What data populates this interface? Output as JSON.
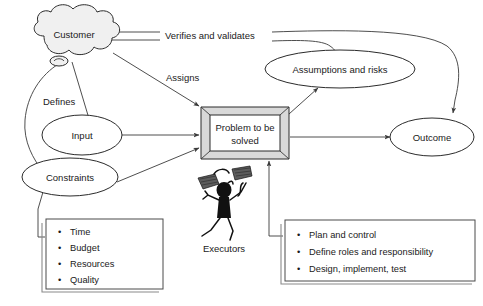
{
  "diagram": {
    "background_color": "#ffffff",
    "nodes": {
      "customer": {
        "label": "Customer",
        "shape": "cloud",
        "fill": "#f0f0f0"
      },
      "input": {
        "label": "Input",
        "shape": "ellipse",
        "fill": "#ffffff"
      },
      "constraints": {
        "label": "Constraints",
        "shape": "ellipse",
        "fill": "#ffffff"
      },
      "problem": {
        "label_line1": "Problem to be",
        "label_line2": "solved",
        "shape": "beveled-box",
        "fill": "#ffffff",
        "bevel_fill": "#d9d9d9"
      },
      "assumptions": {
        "label": "Assumptions and risks",
        "shape": "ellipse",
        "fill": "#ffffff"
      },
      "outcome": {
        "label": "Outcome",
        "shape": "ellipse",
        "fill": "#ffffff"
      },
      "executors": {
        "label": "Executors",
        "shape": "stick-figure-juggler"
      }
    },
    "edge_labels": {
      "verifies": "Verifies and validates",
      "assigns": "Assigns",
      "defines": "Defines"
    },
    "constraints_list": {
      "bullet": "•",
      "items": [
        "Time",
        "Budget",
        "Resources",
        "Quality"
      ]
    },
    "execution_list": {
      "bullet": "•",
      "items": [
        "Plan and control",
        "Define roles and responsibility",
        "Design, implement, test"
      ]
    }
  }
}
